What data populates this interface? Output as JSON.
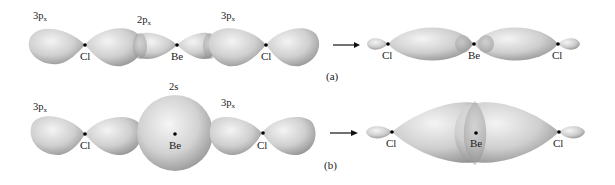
{
  "figure": {
    "panels": [
      {
        "id": "a",
        "label": "(a)",
        "description": "Overlap of Cl 3p orbitals with Be 2p orbital forming BeCl2 bonds",
        "before": {
          "orbital_labels": [
            {
              "main": "3p",
              "sub": "x"
            },
            {
              "main": "2p",
              "sub": "x"
            },
            {
              "main": "3p",
              "sub": "x"
            }
          ],
          "atoms": [
            "Cl",
            "Be",
            "Cl"
          ]
        },
        "after": {
          "atoms": [
            "Cl",
            "Be",
            "Cl"
          ]
        }
      },
      {
        "id": "b",
        "label": "(b)",
        "description": "Overlap of Cl 3p orbitals with Be 2s orbital forming BeCl2 bonds",
        "before": {
          "orbital_labels": [
            {
              "main": "3p",
              "sub": "x"
            },
            {
              "main": "2s",
              "sub": ""
            },
            {
              "main": "3p",
              "sub": "x"
            }
          ],
          "atoms": [
            "Cl",
            "Be",
            "Cl"
          ]
        },
        "after": {
          "atoms": [
            "Cl",
            "Be",
            "Cl"
          ]
        }
      }
    ],
    "arrow_symbol": "→",
    "colors": {
      "orbital_light": "#f2f2f2",
      "orbital_mid": "#c8c8c8",
      "orbital_dark": "#8e8e8e",
      "nucleus": "#000000",
      "text": "#222222"
    }
  }
}
